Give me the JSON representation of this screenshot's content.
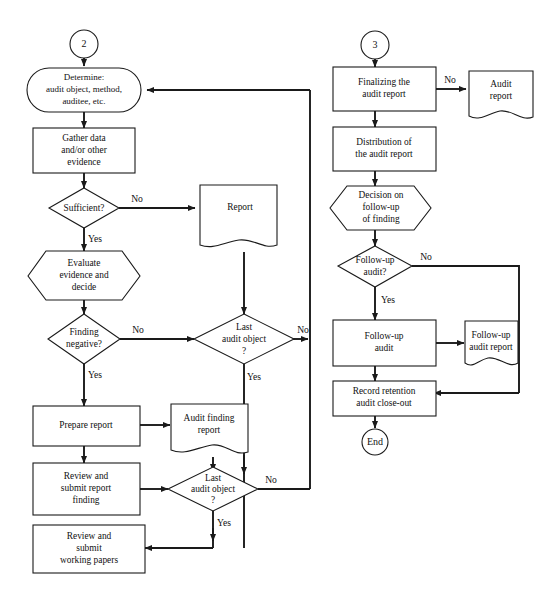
{
  "diagram": {
    "stroke_color": "#1a1a1a",
    "fill_color": "#ffffff"
  },
  "connectors": {
    "start_2": "2",
    "start_3": "3",
    "end": "End"
  },
  "nodes": {
    "determine": {
      "line1": "Determine:",
      "line2": "audit object, method,",
      "line3": "auditee, etc."
    },
    "gather_data": {
      "line1": "Gather data",
      "line2": "and/or other",
      "line3": "evidence"
    },
    "sufficient": {
      "line1": "Sufficient?"
    },
    "report": {
      "line1": "Report"
    },
    "evaluate": {
      "line1": "Evaluate",
      "line2": "evidence and",
      "line3": "decide"
    },
    "finding_negative": {
      "line1": "Finding",
      "line2": "negative?"
    },
    "last_audit_object_top": {
      "line1": "Last",
      "line2": "audit object",
      "line3": "?"
    },
    "prepare_report": {
      "line1": "Prepare report"
    },
    "audit_finding_report": {
      "line1": "Audit finding",
      "line2": "report"
    },
    "review_submit_report_finding": {
      "line1": "Review and",
      "line2": "submit report",
      "line3": "finding"
    },
    "last_audit_object_bottom": {
      "line1": "Last",
      "line2": "audit object",
      "line3": "?"
    },
    "review_submit_working_papers": {
      "line1": "Review and",
      "line2": "submit",
      "line3": "working papers"
    },
    "finalizing_audit_report": {
      "line1": "Finalizing the",
      "line2": "audit report"
    },
    "audit_report": {
      "line1": "Audit",
      "line2": "report"
    },
    "distribution_audit_report": {
      "line1": "Distribution of",
      "line2": "the audit report"
    },
    "decision_follow_up": {
      "line1": "Decision on",
      "line2": "follow-up",
      "line3": "of finding"
    },
    "follow_up_audit_decision": {
      "line1": "Follow-up",
      "line2": "audit?"
    },
    "follow_up_audit": {
      "line1": "Follow-up",
      "line2": "audit"
    },
    "follow_up_audit_report": {
      "line1": "Follow-up",
      "line2": "audit report"
    },
    "record_retention": {
      "line1": "Record retention",
      "line2": "audit close-out"
    }
  },
  "labels": {
    "sufficient_no": "No",
    "sufficient_yes": "Yes",
    "finding_negative_no": "No",
    "finding_negative_yes": "Yes",
    "last_obj_top_no": "No",
    "last_obj_top_yes": "Yes",
    "last_obj_bottom_no": "No",
    "last_obj_bottom_yes": "Yes",
    "finalizing_no": "No",
    "follow_up_no": "No",
    "follow_up_yes": "Yes"
  }
}
